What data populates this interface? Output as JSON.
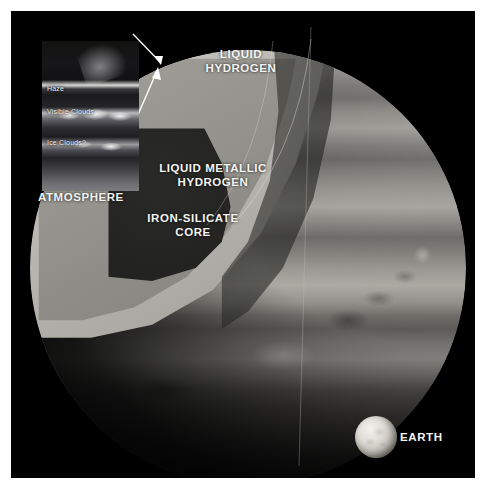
{
  "figure": {
    "background_color": "#ffffff",
    "plate_color": "#000000"
  },
  "planet": {
    "name_implicit": "Jupiter",
    "layers": [
      {
        "id": "liquid-hydrogen",
        "label": "LIQUID\nHYDROGEN",
        "color": "#b2b1ab"
      },
      {
        "id": "liquid-metallic-hydrogen",
        "label": "LIQUID METALLIC\nHYDROGEN",
        "color": "#8d8c86"
      },
      {
        "id": "iron-silicate-core",
        "label": "IRON-SILICATE\nCORE",
        "color": "#161615"
      }
    ],
    "atmosphere_label": "ATMOSPHERE"
  },
  "inset": {
    "title_implicit": "Atmosphere detail",
    "layer_labels": [
      {
        "id": "haze",
        "text": "Haze"
      },
      {
        "id": "visible-clouds",
        "text": "Visible Clouds"
      },
      {
        "id": "ice-clouds",
        "text": "Ice Clouds?"
      }
    ]
  },
  "scale_reference": {
    "label": "EARTH"
  },
  "colors": {
    "label_text": "#f4f4f2",
    "leader_line": "#ffffff",
    "plate": "#000000"
  }
}
